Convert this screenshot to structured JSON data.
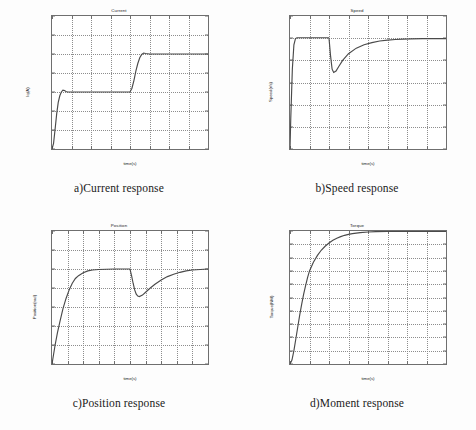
{
  "page": {
    "background_color": "#fdfdfd",
    "axis_color": "#6f6f6f",
    "curve_color": "#4a4a4a",
    "grid_color": "#8d8d8d"
  },
  "panels": [
    {
      "id": "current",
      "caption": "a)Current response",
      "chart_title": "Current",
      "xlabel": "time(s)",
      "ylabel": "Iq(A)"
    },
    {
      "id": "speed",
      "caption": "b)Speed response",
      "chart_title": "Speed",
      "xlabel": "time(s)",
      "ylabel": "Speed(r/s)"
    },
    {
      "id": "position",
      "caption": "c)Position response",
      "chart_title": "Position",
      "xlabel": "time(s)",
      "ylabel": "Position(rad)"
    },
    {
      "id": "torque",
      "caption": "d)Moment response",
      "chart_title": "Torque",
      "xlabel": "time(s)",
      "ylabel": "Torque(NM)"
    }
  ],
  "chart_data": [
    {
      "type": "line",
      "id": "current",
      "title": "Current",
      "xlabel": "time(s)",
      "ylabel": "Iq(A)",
      "xlim": [
        0,
        0.4
      ],
      "ylim": [
        0,
        1.4
      ],
      "xticks": [
        0,
        0.05,
        0.1,
        0.15,
        0.2,
        0.25,
        0.3,
        0.35,
        0.4
      ],
      "xticklabels": [
        "0",
        "0.05",
        "0.1",
        "0.15",
        "0.2",
        "0.25",
        "0.3",
        "0.35",
        "0.4"
      ],
      "yticks": [
        0,
        0.2,
        0.4,
        0.6,
        0.8,
        1,
        1.2,
        1.4
      ],
      "yticklabels": [
        "0",
        "0.2",
        "0.4",
        "0.6",
        "0.8",
        "1",
        "1.2",
        "1.4"
      ],
      "grid": true,
      "legend": null,
      "series": [
        {
          "name": "Iq",
          "x": [
            0,
            0.004,
            0.008,
            0.012,
            0.016,
            0.02,
            0.024,
            0.028,
            0.032,
            0.036,
            0.04,
            0.06,
            0.1,
            0.15,
            0.2,
            0.205,
            0.21,
            0.215,
            0.22,
            0.225,
            0.23,
            0.235,
            0.24,
            0.25,
            0.3,
            0.35,
            0.4
          ],
          "y": [
            0,
            0.06,
            0.21,
            0.37,
            0.49,
            0.56,
            0.6,
            0.62,
            0.615,
            0.605,
            0.6,
            0.6,
            0.6,
            0.6,
            0.6,
            0.64,
            0.72,
            0.82,
            0.9,
            0.96,
            0.995,
            1.01,
            1.005,
            1.0,
            1.0,
            1.0,
            1.0
          ]
        }
      ]
    },
    {
      "type": "line",
      "id": "speed",
      "title": "Speed",
      "xlabel": "time(s)",
      "ylabel": "Speed(r/s)",
      "xlim": [
        0,
        0.4
      ],
      "ylim": [
        0,
        600
      ],
      "xticks": [
        0,
        0.05,
        0.1,
        0.15,
        0.2,
        0.25,
        0.3,
        0.35,
        0.4
      ],
      "xticklabels": [
        "0",
        "0.05",
        "0.1",
        "0.15",
        "0.2",
        "0.25",
        "0.3",
        "0.35",
        "0.4"
      ],
      "yticks": [
        0,
        100,
        200,
        300,
        400,
        500,
        600
      ],
      "yticklabels": [
        "0",
        "100",
        "200",
        "300",
        "400",
        "500",
        "600"
      ],
      "grid": true,
      "legend": null,
      "series": [
        {
          "name": "Speed",
          "x": [
            0,
            0.002,
            0.006,
            0.01,
            0.014,
            0.018,
            0.03,
            0.05,
            0.08,
            0.099,
            0.1,
            0.104,
            0.108,
            0.112,
            0.118,
            0.125,
            0.135,
            0.15,
            0.17,
            0.19,
            0.21,
            0.23,
            0.25,
            0.27,
            0.29,
            0.31,
            0.34,
            0.37,
            0.4
          ],
          "y": [
            0,
            140,
            360,
            470,
            498,
            502,
            502,
            502,
            502,
            502,
            500,
            420,
            360,
            345,
            352,
            372,
            400,
            430,
            455,
            470,
            480,
            487,
            491,
            494,
            496,
            497,
            498,
            498,
            498
          ]
        }
      ]
    },
    {
      "type": "line",
      "id": "position",
      "title": "Position",
      "xlabel": "time(s)",
      "ylabel": "Position(rad)",
      "xlim": [
        0,
        1
      ],
      "ylim": [
        0,
        1.4
      ],
      "xticks": [
        0,
        0.1,
        0.2,
        0.3,
        0.4,
        0.5,
        0.6,
        0.7,
        0.8,
        0.9,
        1
      ],
      "xticklabels": [
        "0",
        "0.1",
        "0.2",
        "0.3",
        "0.4",
        "0.5",
        "0.6",
        "0.7",
        "0.8",
        "0.9",
        "1"
      ],
      "yticks": [
        0,
        0.2,
        0.4,
        0.6,
        0.8,
        1,
        1.2,
        1.4
      ],
      "yticklabels": [
        "0",
        "0.2",
        "0.4",
        "0.6",
        "0.8",
        "1",
        "1.2",
        "1.4"
      ],
      "grid": true,
      "legend": null,
      "series": [
        {
          "name": "Position",
          "x": [
            0,
            0.01,
            0.02,
            0.035,
            0.05,
            0.07,
            0.09,
            0.11,
            0.13,
            0.15,
            0.17,
            0.2,
            0.23,
            0.26,
            0.3,
            0.4,
            0.49,
            0.5,
            0.51,
            0.52,
            0.53,
            0.54,
            0.55,
            0.56,
            0.58,
            0.6,
            0.63,
            0.66,
            0.7,
            0.74,
            0.78,
            0.82,
            0.86,
            0.9,
            0.95,
            1.0
          ],
          "y": [
            0,
            0.1,
            0.2,
            0.33,
            0.44,
            0.58,
            0.69,
            0.78,
            0.85,
            0.9,
            0.93,
            0.96,
            0.98,
            0.99,
            0.995,
            1.0,
            1.0,
            1.0,
            0.93,
            0.85,
            0.78,
            0.735,
            0.715,
            0.71,
            0.725,
            0.755,
            0.8,
            0.84,
            0.885,
            0.92,
            0.945,
            0.965,
            0.98,
            0.99,
            0.995,
            1.0
          ]
        }
      ]
    },
    {
      "type": "line",
      "id": "torque",
      "title": "Torque",
      "xlabel": "time(s)",
      "ylabel": "Torque(NM)",
      "xlim": [
        0,
        0.4
      ],
      "ylim": [
        0,
        2
      ],
      "xticks": [
        0,
        0.05,
        0.1,
        0.15,
        0.2,
        0.25,
        0.3,
        0.35,
        0.4
      ],
      "xticklabels": [
        "0",
        "0.05",
        "0.1",
        "0.15",
        "0.2",
        "0.25",
        "0.3",
        "0.35",
        "0.4"
      ],
      "yticks": [
        0,
        0.2,
        0.4,
        0.6,
        0.8,
        1,
        1.2,
        1.4,
        1.6,
        1.8,
        2
      ],
      "yticklabels": [
        "0",
        "0.2",
        "0.4",
        "0.6",
        "0.8",
        "1",
        "1.2",
        "1.4",
        "1.6",
        "1.8",
        "2"
      ],
      "grid": true,
      "legend": null,
      "series": [
        {
          "name": "Torque",
          "x": [
            0,
            0.005,
            0.01,
            0.015,
            0.02,
            0.025,
            0.03,
            0.035,
            0.04,
            0.045,
            0.05,
            0.06,
            0.07,
            0.08,
            0.09,
            0.1,
            0.11,
            0.12,
            0.13,
            0.14,
            0.15,
            0.16,
            0.18,
            0.2,
            0.22,
            0.25,
            0.3,
            0.35,
            0.4
          ],
          "y": [
            0,
            0.06,
            0.2,
            0.38,
            0.56,
            0.74,
            0.9,
            1.05,
            1.18,
            1.3,
            1.4,
            1.53,
            1.63,
            1.71,
            1.77,
            1.82,
            1.86,
            1.89,
            1.915,
            1.935,
            1.95,
            1.96,
            1.975,
            1.985,
            1.99,
            1.995,
            1.995,
            1.995,
            1.995
          ]
        }
      ]
    }
  ]
}
